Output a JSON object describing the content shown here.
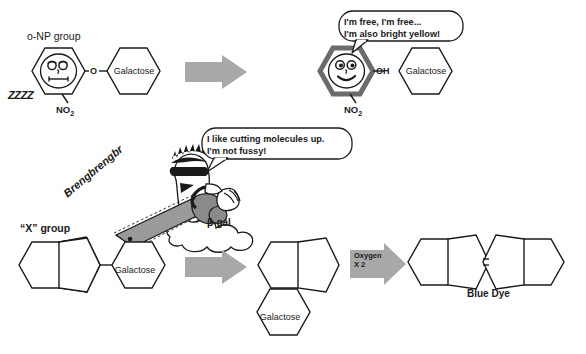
{
  "diagram": {
    "title_hidden": "",
    "colors": {
      "arrow_gray": "#a8a8a8",
      "hex_dark_outline": "#6b6b6b",
      "line_black": "#1a1a1a",
      "chainsaw_gray": "#9a9a9a",
      "background": "#ffffff"
    }
  },
  "top_reaction": {
    "substrate": {
      "group_label": "o-NP group",
      "sleep_sound": "ZZZZ",
      "nitro_label": "NO2",
      "linker_atom": "O",
      "sugar_label": "Galactose"
    },
    "arrow": {
      "label": ""
    },
    "product": {
      "speech": {
        "line1": "I'm free, I'm free...",
        "line2": "I'm also bright yellow!"
      },
      "hydroxyl_label": "OH",
      "nitro_label": "NO2",
      "sugar_label": "Galactose"
    }
  },
  "enzyme": {
    "name_label": "β-gal",
    "sound_effect": "Brengbrengbr",
    "speech": {
      "line1": "I like cutting molecules up.",
      "line2": "I'm not fussy!"
    }
  },
  "bottom_reaction": {
    "substrate": {
      "group_label": "“X” group",
      "sugar_label": "Galactose"
    },
    "arrow1": {
      "label": ""
    },
    "intermediate": {
      "sugar_label": "Galactose"
    },
    "arrow2": {
      "line1": "Oxygen",
      "line2": "X 2"
    },
    "product": {
      "name_label": "Blue Dye"
    }
  }
}
